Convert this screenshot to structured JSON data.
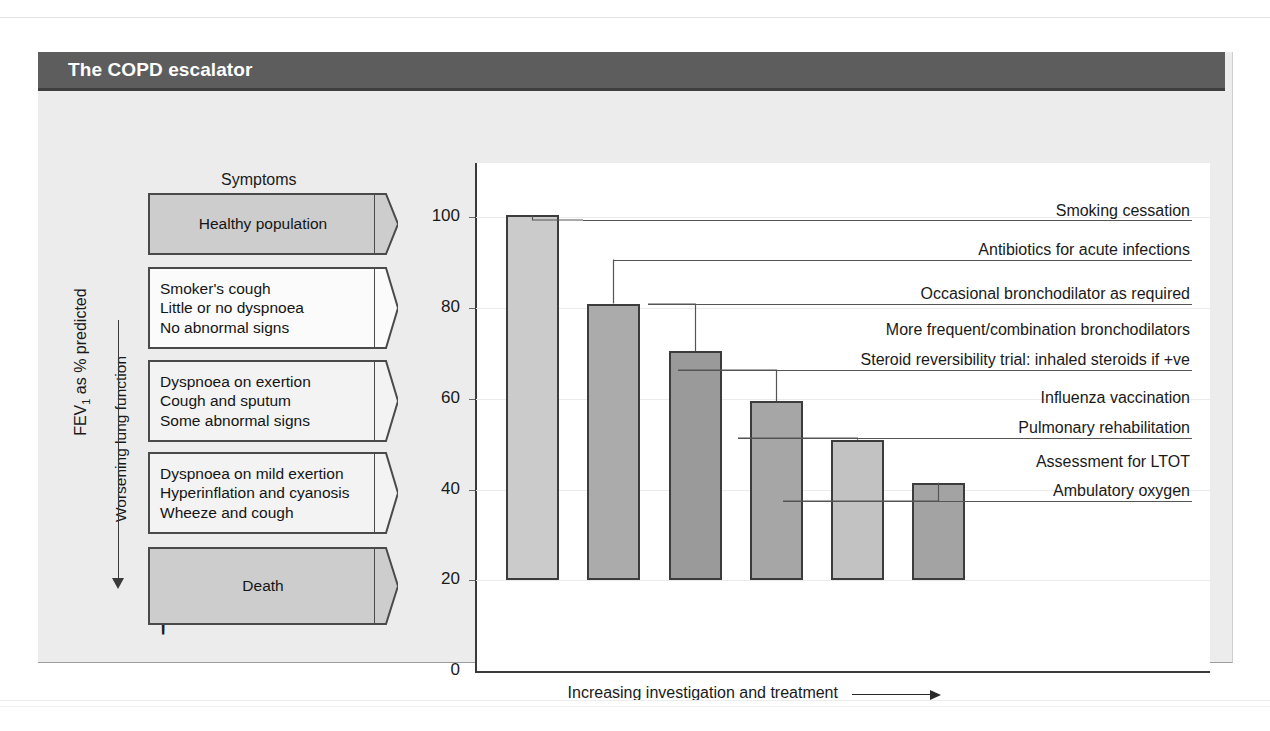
{
  "figure": {
    "title": "The COPD escalator",
    "title_bg": "#5d5d5d"
  },
  "left_panel": {
    "heading": "Symptoms",
    "axis_label": "Worsening lung function",
    "death_marker": "†",
    "stages": [
      {
        "lines": [
          "Healthy population"
        ],
        "align": "center",
        "fill": "dark"
      },
      {
        "lines": [
          "Smoker's cough",
          "Little or no dyspnoea",
          "No abnormal signs"
        ],
        "align": "left",
        "fill": "light"
      },
      {
        "lines": [
          "Dyspnoea on exertion",
          "Cough and sputum",
          "Some abnormal signs"
        ],
        "align": "left",
        "fill": "hatch"
      },
      {
        "lines": [
          "Dyspnoea on mild exertion",
          "Hyperinflation and cyanosis",
          "Wheeze and cough"
        ],
        "align": "left",
        "fill": "hatch"
      },
      {
        "lines": [
          "Death"
        ],
        "align": "center",
        "fill": "dark"
      }
    ]
  },
  "treatments": [
    "Smoking cessation",
    "Antibiotics for acute infections",
    "Occasional bronchodilator as required",
    "More frequent/combination bronchodilators",
    "Steroid reversibility trial: inhaled steroids if +ve",
    "Influenza vaccination",
    "Pulmonary rehabilitation",
    "Assessment for LTOT",
    "Ambulatory oxygen"
  ],
  "chart_data": {
    "type": "bar",
    "title": "The COPD escalator",
    "xlabel": "Increasing investigation and treatment",
    "ylabel": "FEV1 as % predicted",
    "ylabel_display": "FEV as % predicted",
    "ylim": [
      0,
      112
    ],
    "yticks": [
      0,
      20,
      40,
      60,
      80,
      100
    ],
    "ytick_labels": [
      "0",
      "20",
      "40",
      "60",
      "80",
      "100"
    ],
    "baseline": 20,
    "grid": true,
    "legend": "none",
    "categories": [
      "1",
      "2",
      "3",
      "4",
      "5",
      "6"
    ],
    "values": [
      100.5,
      81,
      70.5,
      59.5,
      51,
      41.5
    ],
    "bar_colors": [
      "#cbcbcb",
      "#ababab",
      "#9a9a9a",
      "#a6a6a6",
      "#c2c2c2",
      "#a3a3a3"
    ],
    "annotations": [
      "Smoking cessation",
      "Antibiotics for acute infections",
      "Occasional bronchodilator as required",
      "More frequent/combination bronchodilators",
      "Steroid reversibility trial: inhaled steroids if +ve",
      "Influenza vaccination",
      "Pulmonary rehabilitation",
      "Assessment for LTOT",
      "Ambulatory oxygen"
    ]
  }
}
